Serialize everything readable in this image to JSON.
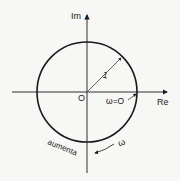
{
  "diagram": {
    "axes": {
      "x_label": "Re",
      "y_label": "Im",
      "origin_label": "O"
    },
    "circle": {
      "radius_label": "1"
    },
    "start_point_label": "ω=O",
    "direction_label": "aumenta",
    "omega_label": "ω",
    "colors": {
      "stroke": "#1a1a1a",
      "background": "#f7f7f5"
    }
  }
}
